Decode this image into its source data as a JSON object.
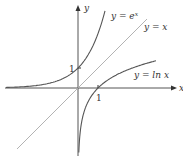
{
  "chart_data": {
    "type": "line",
    "title": "",
    "xlabel": "x",
    "ylabel": "y",
    "xlim": [
      -3.65,
      4.95
    ],
    "ylim": [
      -3.35,
      4.1
    ],
    "grid": false,
    "legend": "none (curves labeled inline)",
    "ticks": {
      "x": [
        {
          "value": 1,
          "label": "1"
        }
      ],
      "y": [
        {
          "value": 1,
          "label": "1"
        }
      ]
    },
    "series": [
      {
        "name": "y = e^x",
        "label_base": "y = e",
        "label_exp": "x",
        "function": "exp",
        "x": [
          -3.6,
          -3,
          -2.5,
          -2,
          -1.5,
          -1,
          -0.5,
          0,
          0.5,
          1,
          1.25,
          1.35
        ],
        "y": [
          0.027,
          0.05,
          0.082,
          0.135,
          0.223,
          0.368,
          0.607,
          1,
          1.649,
          2.718,
          3.49,
          3.86
        ],
        "color": "#555555"
      },
      {
        "name": "y = x",
        "label": "y = x",
        "function": "identity",
        "x": [
          -3.05,
          3.45
        ],
        "y": [
          -3.05,
          3.45
        ],
        "color": "#aaaaaa"
      },
      {
        "name": "y = ln x",
        "label": "y = ln x",
        "function": "log",
        "x": [
          0.04,
          0.06,
          0.1,
          0.2,
          0.35,
          0.5,
          0.75,
          1,
          1.5,
          2,
          2.5,
          3,
          3.5,
          3.9
        ],
        "y": [
          -3.22,
          -2.81,
          -2.3,
          -1.61,
          -1.05,
          -0.69,
          -0.29,
          0,
          0.41,
          0.69,
          0.92,
          1.1,
          1.25,
          1.36
        ],
        "color": "#555555"
      }
    ]
  },
  "axes": {
    "x_label": "x",
    "y_label": "y",
    "x_tick_label": "1",
    "y_tick_label": "1"
  },
  "labels": {
    "exp_base": "y = e",
    "exp_sup": "x",
    "identity": "y = x",
    "log": "y = ln x"
  }
}
